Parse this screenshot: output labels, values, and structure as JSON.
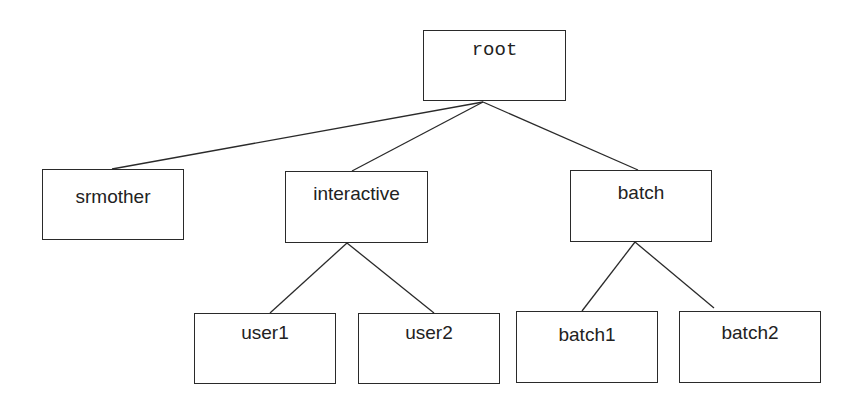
{
  "diagram": {
    "type": "tree",
    "nodes": [
      {
        "id": "root",
        "label": "root",
        "mono": true,
        "box": {
          "x": 423,
          "y": 30,
          "w": 143,
          "h": 71
        },
        "label_top": 8
      },
      {
        "id": "srmother",
        "label": "srmother",
        "box": {
          "x": 42,
          "y": 169,
          "w": 142,
          "h": 71
        },
        "label_top": 16
      },
      {
        "id": "interactive",
        "label": "interactive",
        "box": {
          "x": 285,
          "y": 171,
          "w": 143,
          "h": 72
        },
        "label_top": 11
      },
      {
        "id": "batch",
        "label": "batch",
        "box": {
          "x": 570,
          "y": 170,
          "w": 142,
          "h": 72
        },
        "label_top": 11
      },
      {
        "id": "user1",
        "label": "user1",
        "box": {
          "x": 194,
          "y": 313,
          "w": 142,
          "h": 71
        },
        "label_top": 8
      },
      {
        "id": "user2",
        "label": "user2",
        "box": {
          "x": 358,
          "y": 313,
          "w": 142,
          "h": 71
        },
        "label_top": 8
      },
      {
        "id": "batch1",
        "label": "batch1",
        "box": {
          "x": 516,
          "y": 311,
          "w": 142,
          "h": 72
        },
        "label_top": 12
      },
      {
        "id": "batch2",
        "label": "batch2",
        "box": {
          "x": 679,
          "y": 311,
          "w": 142,
          "h": 72
        },
        "label_top": 10
      }
    ],
    "edges": [
      {
        "from": "root",
        "to": "srmother",
        "x1": 483,
        "y1": 102,
        "x2": 112,
        "y2": 169
      },
      {
        "from": "root",
        "to": "interactive",
        "x1": 483,
        "y1": 102,
        "x2": 352,
        "y2": 171
      },
      {
        "from": "root",
        "to": "batch",
        "x1": 483,
        "y1": 102,
        "x2": 638,
        "y2": 170
      },
      {
        "from": "interactive",
        "to": "user1",
        "x1": 347,
        "y1": 243,
        "x2": 270,
        "y2": 313
      },
      {
        "from": "interactive",
        "to": "user2",
        "x1": 347,
        "y1": 243,
        "x2": 434,
        "y2": 313
      },
      {
        "from": "batch",
        "to": "batch1",
        "x1": 635,
        "y1": 242,
        "x2": 582,
        "y2": 311
      },
      {
        "from": "batch",
        "to": "batch2",
        "x1": 635,
        "y1": 242,
        "x2": 714,
        "y2": 308
      }
    ],
    "colors": {
      "stroke": "#2a2a2a",
      "text": "#222222",
      "background": "#ffffff"
    }
  }
}
